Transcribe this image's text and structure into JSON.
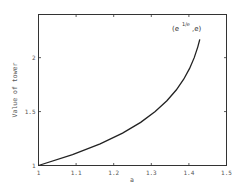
{
  "chart_data": {
    "type": "line",
    "title": "",
    "xlabel": "a",
    "ylabel": "Value of tower",
    "xlim": [
      1,
      1.5
    ],
    "ylim": [
      1,
      2.4
    ],
    "x_ticks": [
      "1",
      "1.1",
      "1.2",
      "1.3",
      "1.4",
      "1.5"
    ],
    "y_ticks": [
      "1",
      "1.5",
      "2"
    ],
    "grid": false,
    "legend": null,
    "series": [
      {
        "name": "infinite power tower a^a^a...",
        "x": [
          1.0,
          1.0905,
          1.164,
          1.2236,
          1.2717,
          1.3104,
          1.3415,
          1.3663,
          1.3862,
          1.4019,
          1.4142,
          1.4237,
          1.429
        ],
        "y": [
          1.0,
          1.1,
          1.2,
          1.3,
          1.4,
          1.5,
          1.6,
          1.7,
          1.8,
          1.9,
          2.0,
          2.1,
          2.17
        ]
      }
    ],
    "annotations": [
      {
        "text": "(e^{1/e}, e)",
        "base": "(e",
        "sup": "1/e",
        "tail": ",e)",
        "x": 1.41,
        "y": 2.28
      }
    ]
  },
  "colors": {
    "line": "#222222",
    "frame": "#333333",
    "text": "#555555"
  }
}
